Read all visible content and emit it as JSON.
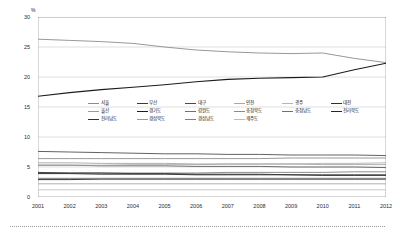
{
  "chart_data": {
    "type": "line",
    "title": "",
    "subtitle": "",
    "xlabel": "",
    "ylabel": "",
    "unit_label": "%",
    "x": [
      2001,
      2002,
      2003,
      2004,
      2005,
      2006,
      2007,
      2008,
      2009,
      2010,
      2011,
      2012
    ],
    "xtick_labels": [
      "2001",
      "2002",
      "2003",
      "2004",
      "2005",
      "2006",
      "2007",
      "2008",
      "2009",
      "2010",
      "2011",
      "2012"
    ],
    "ytick_labels": [
      "0",
      "5",
      "10",
      "15",
      "20",
      "25",
      "30"
    ],
    "yticks": [
      0,
      5,
      10,
      15,
      20,
      25,
      30
    ],
    "ylim": [
      0,
      30
    ],
    "xlim": [
      2001,
      2012
    ],
    "grid": "horizontal",
    "legend_position": "center",
    "legend_columns": 6,
    "series": [
      {
        "name": "서울",
        "color": "#8c8c8c",
        "width": 0.9,
        "values": [
          26.3,
          26.1,
          25.9,
          25.6,
          25.0,
          24.5,
          24.2,
          24.0,
          23.9,
          24.0,
          23.1,
          22.4
        ]
      },
      {
        "name": "부산",
        "color": "#3a3a3a",
        "width": 0.8,
        "values": [
          7.6,
          7.5,
          7.4,
          7.3,
          7.2,
          7.2,
          7.1,
          7.1,
          7.0,
          7.0,
          7.0,
          6.9
        ]
      },
      {
        "name": "대구",
        "color": "#4a4a4a",
        "width": 0.8,
        "values": [
          5.3,
          5.3,
          5.2,
          5.2,
          5.2,
          5.1,
          5.1,
          5.1,
          5.0,
          5.0,
          5.0,
          4.9
        ]
      },
      {
        "name": "인천",
        "color": "#a8a8a8",
        "width": 0.8,
        "values": [
          5.3,
          5.3,
          5.3,
          5.4,
          5.4,
          5.4,
          5.5,
          5.5,
          5.5,
          5.6,
          5.6,
          5.7
        ]
      },
      {
        "name": "광주",
        "color": "#b5b5b5",
        "width": 0.8,
        "values": [
          2.9,
          2.9,
          2.9,
          2.9,
          2.9,
          2.9,
          2.9,
          2.9,
          2.9,
          2.9,
          2.9,
          2.9
        ]
      },
      {
        "name": "대전",
        "color": "#2e2e2e",
        "width": 0.9,
        "values": [
          2.9,
          2.9,
          3.0,
          3.0,
          3.0,
          3.0,
          3.0,
          3.0,
          3.0,
          3.0,
          3.0,
          3.0
        ]
      },
      {
        "name": "울산",
        "color": "#9c9c9c",
        "width": 0.8,
        "values": [
          2.2,
          2.2,
          2.2,
          2.2,
          2.2,
          2.2,
          2.2,
          2.2,
          2.2,
          2.2,
          2.2,
          2.2
        ]
      },
      {
        "name": "경기도",
        "color": "#1c1c1c",
        "width": 1.1,
        "values": [
          16.8,
          17.4,
          17.9,
          18.3,
          18.7,
          19.2,
          19.6,
          19.8,
          19.9,
          20.0,
          21.2,
          22.3
        ]
      },
      {
        "name": "강원도",
        "color": "#707070",
        "width": 0.8,
        "values": [
          3.1,
          3.1,
          3.1,
          3.1,
          3.1,
          3.1,
          3.1,
          3.1,
          3.1,
          3.1,
          3.1,
          3.1
        ]
      },
      {
        "name": "충청북도",
        "color": "#8a8a8a",
        "width": 0.8,
        "values": [
          3.1,
          3.1,
          3.1,
          3.1,
          3.1,
          3.1,
          3.1,
          3.1,
          3.1,
          3.1,
          3.1,
          3.1
        ]
      },
      {
        "name": "충청남도",
        "color": "#707070",
        "width": 0.8,
        "values": [
          4.0,
          4.0,
          4.0,
          4.0,
          4.0,
          4.0,
          4.1,
          4.1,
          4.1,
          4.1,
          4.2,
          4.2
        ]
      },
      {
        "name": "전라북도",
        "color": "#262626",
        "width": 0.9,
        "values": [
          3.9,
          3.9,
          3.8,
          3.8,
          3.8,
          3.7,
          3.7,
          3.7,
          3.7,
          3.6,
          3.6,
          3.6
        ]
      },
      {
        "name": "전라남도",
        "color": "#333333",
        "width": 0.9,
        "values": [
          4.1,
          4.0,
          4.0,
          3.9,
          3.9,
          3.8,
          3.8,
          3.8,
          3.7,
          3.7,
          3.7,
          3.7
        ]
      },
      {
        "name": "경상북도",
        "color": "#9a9a9a",
        "width": 0.8,
        "values": [
          5.7,
          5.7,
          5.6,
          5.6,
          5.6,
          5.5,
          5.5,
          5.5,
          5.5,
          5.4,
          5.4,
          5.4
        ]
      },
      {
        "name": "경상남도",
        "color": "#808080",
        "width": 0.8,
        "values": [
          6.4,
          6.4,
          6.4,
          6.4,
          6.4,
          6.4,
          6.4,
          6.4,
          6.5,
          6.5,
          6.5,
          6.5
        ]
      },
      {
        "name": "제주도",
        "color": "#bdbdbd",
        "width": 0.8,
        "values": [
          1.2,
          1.2,
          1.2,
          1.2,
          1.2,
          1.2,
          1.2,
          1.2,
          1.2,
          1.2,
          1.2,
          1.2
        ]
      }
    ]
  }
}
